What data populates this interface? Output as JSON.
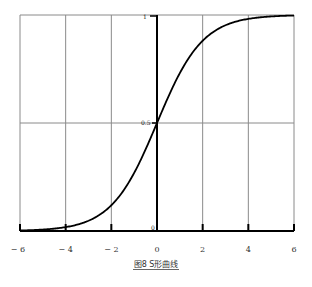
{
  "chart_data": {
    "type": "line",
    "title": "",
    "caption": "图8   S形曲线",
    "xlabel": "",
    "ylabel": "",
    "xlim": [
      -6,
      6
    ],
    "ylim": [
      0,
      1
    ],
    "x_ticks": [
      "-6",
      "-4",
      "-2",
      "0",
      "2",
      "4",
      "6"
    ],
    "y_labels": {
      "top": "1",
      "mid": "0.5",
      "origin": "0"
    },
    "grid": true,
    "series": [
      {
        "name": "sigmoid",
        "function": "1/(1+e^-x)",
        "x": [
          -6,
          -5,
          -4,
          -3,
          -2,
          -1,
          0,
          1,
          2,
          3,
          4,
          5,
          6
        ],
        "values": [
          0.002,
          0.007,
          0.018,
          0.047,
          0.119,
          0.269,
          0.5,
          0.731,
          0.881,
          0.953,
          0.982,
          0.993,
          0.998
        ],
        "color": "#000000"
      }
    ]
  }
}
